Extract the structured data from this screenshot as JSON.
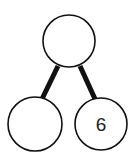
{
  "diagram": {
    "type": "number-bond",
    "colors": {
      "stroke": "#111111",
      "fill": "#ffffff",
      "text": "#222222"
    },
    "nodes": [
      {
        "id": "whole",
        "position": "top",
        "label": ""
      },
      {
        "id": "part-left",
        "position": "bottom-left",
        "label": ""
      },
      {
        "id": "part-right",
        "position": "bottom-right",
        "label": "6"
      }
    ],
    "edges": [
      {
        "from": "whole",
        "to": "part-left"
      },
      {
        "from": "whole",
        "to": "part-right"
      }
    ]
  }
}
